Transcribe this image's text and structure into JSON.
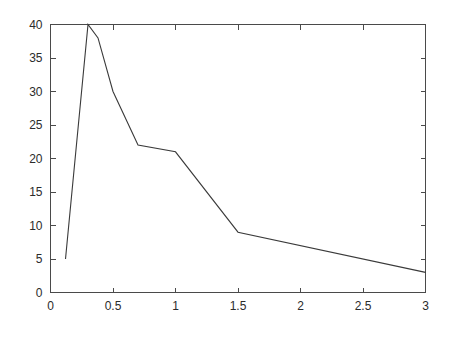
{
  "chart_data": {
    "type": "line",
    "title": "",
    "subtitle": "",
    "xlabel": "",
    "ylabel": "",
    "xlim": [
      0,
      3
    ],
    "ylim": [
      0,
      40
    ],
    "grid": false,
    "legend": null,
    "x_ticks": [
      0,
      0.5,
      1,
      1.5,
      2,
      2.5,
      3
    ],
    "x_tick_labels": [
      "0",
      "0.5",
      "1",
      "1.5",
      "2",
      "2.5",
      "3"
    ],
    "y_ticks": [
      0,
      5,
      10,
      15,
      20,
      25,
      30,
      35,
      40
    ],
    "y_tick_labels": [
      "0",
      "5",
      "10",
      "15",
      "20",
      "25",
      "30",
      "35",
      "40"
    ],
    "series": [
      {
        "name": "series-1",
        "color": "#3a3a3a",
        "x": [
          0.12,
          0.3,
          0.38,
          0.5,
          0.7,
          1.0,
          1.5,
          3.0
        ],
        "y": [
          5,
          40,
          38,
          30,
          22,
          21,
          9,
          3
        ]
      }
    ]
  },
  "axes": {
    "box_color": "#4a4a4a",
    "background": "#ffffff",
    "tick_direction": "in"
  }
}
